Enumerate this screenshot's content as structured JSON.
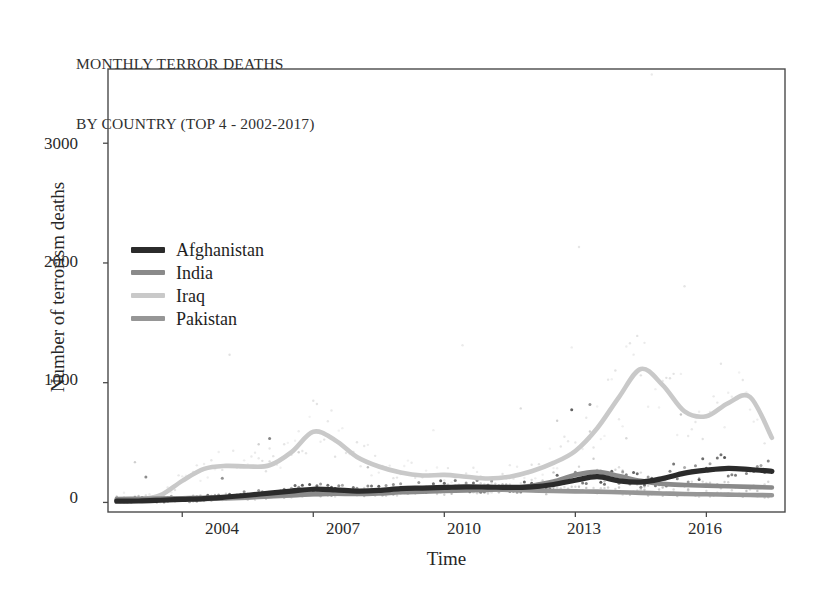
{
  "chart_data": {
    "type": "line",
    "title": "MONTHLY TERROR DEATHS\nBY COUNTRY (TOP 4 - 2002-2017)",
    "title_lines": [
      "MONTHLY TERROR DEATHS",
      "BY COUNTRY (TOP 4 - 2002-2017)"
    ],
    "xlabel": "Time",
    "ylabel": "Number of terrorism deaths",
    "xlim": [
      2002.3,
      2017.8
    ],
    "ylim": [
      -80,
      3620
    ],
    "xticks": [
      2004,
      2007,
      2010,
      2013,
      2016
    ],
    "xtick_labels": [
      "2004",
      "2007",
      "2010",
      "2013",
      "2016"
    ],
    "yticks": [
      0,
      1000,
      2000,
      3000
    ],
    "ytick_labels": [
      "0",
      "1000",
      "2000",
      "3000"
    ],
    "grid": false,
    "legend_position": "upper-left-inside",
    "has_scatter_overlay": true,
    "scatter_note": "faint monthly raw data points plotted behind the smoothed trend lines",
    "x": [
      2002.5,
      2003.0,
      2003.5,
      2004.0,
      2004.5,
      2005.0,
      2005.5,
      2006.0,
      2006.5,
      2007.0,
      2007.5,
      2008.0,
      2008.5,
      2009.0,
      2009.5,
      2010.0,
      2010.5,
      2011.0,
      2011.5,
      2012.0,
      2012.5,
      2013.0,
      2013.5,
      2014.0,
      2014.5,
      2015.0,
      2015.5,
      2016.0,
      2016.5,
      2017.0,
      2017.5
    ],
    "series": [
      {
        "name": "Afghanistan",
        "color": "#2b2b2b",
        "values": [
          10,
          12,
          18,
          25,
          32,
          45,
          60,
          78,
          95,
          110,
          105,
          95,
          100,
          115,
          120,
          125,
          130,
          128,
          125,
          130,
          150,
          185,
          215,
          180,
          170,
          200,
          245,
          270,
          285,
          275,
          260
        ]
      },
      {
        "name": "India",
        "color": "#8a8a8a",
        "values": [
          28,
          30,
          32,
          35,
          38,
          42,
          48,
          55,
          62,
          70,
          72,
          70,
          75,
          85,
          90,
          95,
          100,
          105,
          118,
          140,
          175,
          230,
          255,
          220,
          180,
          155,
          145,
          140,
          135,
          130,
          125
        ]
      },
      {
        "name": "Iraq",
        "color": "#c9c9c9",
        "values": [
          20,
          25,
          60,
          180,
          280,
          305,
          300,
          310,
          420,
          590,
          520,
          380,
          300,
          250,
          225,
          230,
          215,
          200,
          215,
          260,
          330,
          430,
          620,
          880,
          1115,
          980,
          760,
          720,
          830,
          880,
          540
        ]
      },
      {
        "name": "Pakistan",
        "color": "#969696",
        "values": [
          18,
          20,
          22,
          25,
          28,
          33,
          40,
          50,
          58,
          68,
          72,
          80,
          92,
          100,
          105,
          110,
          112,
          110,
          105,
          100,
          95,
          92,
          90,
          85,
          80,
          75,
          70,
          68,
          65,
          62,
          60
        ]
      }
    ],
    "annotations": [
      {
        "text": "Iraq peak ~1115 around 2014",
        "x": 2014.5,
        "y": 1115
      },
      {
        "text": "Iraq secondary peak ~880 around 2016-2017",
        "x": 2017.0,
        "y": 880
      },
      {
        "text": "Iraq 2007 peak ~590",
        "x": 2007.0,
        "y": 590
      }
    ]
  },
  "legend": {
    "items": [
      {
        "label": "Afghanistan",
        "color": "#2b2b2b"
      },
      {
        "label": "India",
        "color": "#8a8a8a"
      },
      {
        "label": "Iraq",
        "color": "#c9c9c9"
      },
      {
        "label": "Pakistan",
        "color": "#969696"
      }
    ]
  },
  "frame": {
    "color": "#4a4a4a"
  }
}
